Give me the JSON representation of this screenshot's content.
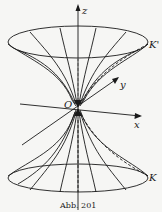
{
  "figure": {
    "caption": "Abb. 201",
    "labels": {
      "z_axis": "z",
      "y_axis": "y",
      "x_axis": "x",
      "origin": "O",
      "upper_curve": "K'",
      "lower_curve": "K"
    },
    "colors": {
      "ink": "#1a1a1a",
      "paper": "#f6f6f4"
    }
  }
}
